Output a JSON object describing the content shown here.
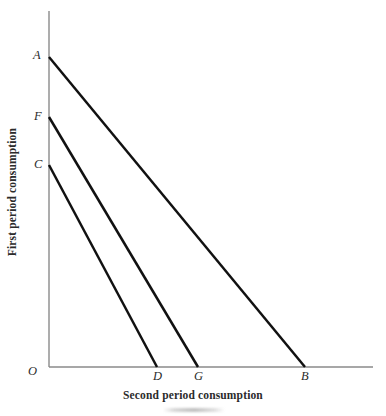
{
  "figure": {
    "title_caption": "",
    "background_color": "#ffffff"
  },
  "axes": {
    "y_title": "First period consumption",
    "x_title": "Second period consumption",
    "axis_color": "#8a8a8a",
    "origin_label": "O"
  },
  "labels": {
    "A": "A",
    "F": "F",
    "C": "C",
    "O": "O",
    "D": "D",
    "G": "G",
    "B": "B"
  },
  "chart_data": {
    "type": "line",
    "title": "",
    "subtitle": "",
    "xlabel": "Second period consumption",
    "ylabel": "First period consumption",
    "xlim": [
      0,
      100
    ],
    "ylim": [
      0,
      100
    ],
    "grid": false,
    "legend": "none",
    "line_color": "#111111",
    "line_width_px": 2.5,
    "series": [
      {
        "name": "AB",
        "start_label": "A",
        "end_label": "B",
        "x": [
          0,
          79.0
        ],
        "y": [
          87.1,
          0
        ]
      },
      {
        "name": "FG",
        "start_label": "F",
        "end_label": "G",
        "x": [
          0,
          46.0
        ],
        "y": [
          70.2,
          0
        ]
      },
      {
        "name": "CD",
        "start_label": "C",
        "end_label": "D",
        "x": [
          0,
          33.3
        ],
        "y": [
          56.7,
          0
        ]
      }
    ],
    "annotations": [
      {
        "text": "A",
        "x": 0,
        "y": 87.1,
        "position": "left"
      },
      {
        "text": "F",
        "x": 0,
        "y": 70.2,
        "position": "left"
      },
      {
        "text": "C",
        "x": 0,
        "y": 56.7,
        "position": "left"
      },
      {
        "text": "O",
        "x": 0,
        "y": 0,
        "position": "below-left"
      },
      {
        "text": "D",
        "x": 33.3,
        "y": 0,
        "position": "below"
      },
      {
        "text": "G",
        "x": 46.0,
        "y": 0,
        "position": "below"
      },
      {
        "text": "B",
        "x": 79.0,
        "y": 0,
        "position": "below"
      }
    ]
  },
  "geometry_px": {
    "origin": {
      "x": 49,
      "y": 367
    },
    "y_axis_top": {
      "x": 49,
      "y": 11
    },
    "x_axis_right": {
      "x": 373,
      "y": 367
    },
    "A": {
      "x": 49,
      "y": 57
    },
    "F": {
      "x": 49,
      "y": 117
    },
    "C": {
      "x": 49,
      "y": 165
    },
    "D": {
      "x": 157,
      "y": 367
    },
    "G": {
      "x": 198,
      "y": 367
    },
    "B": {
      "x": 305,
      "y": 367
    }
  }
}
